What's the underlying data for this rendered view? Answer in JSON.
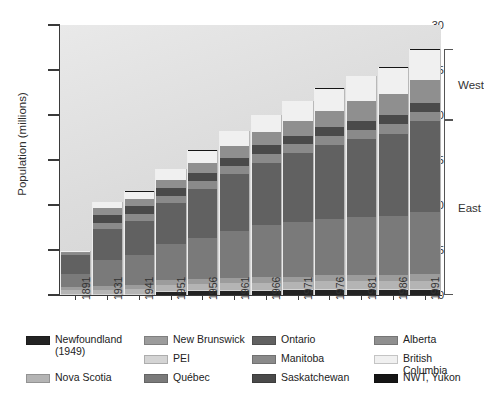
{
  "chart_data": {
    "type": "bar",
    "stacked": true,
    "title": "",
    "xlabel": "",
    "ylabel": "Population (millions)",
    "ylim": [
      0,
      30
    ],
    "yticks": [
      0,
      5,
      10,
      15,
      20,
      25,
      30
    ],
    "ytick_labels": [
      "0",
      "5",
      "10",
      "15",
      "20",
      "25",
      "30"
    ],
    "grid": false,
    "legend_position": "bottom",
    "categories": [
      "1891",
      "1931",
      "1941",
      "1951",
      "1956",
      "1961",
      "1966",
      "1971",
      "1976",
      "1981",
      "1986",
      "1991"
    ],
    "totals": [
      4.8,
      10.4,
      11.5,
      14.0,
      16.0,
      18.2,
      20.0,
      21.6,
      23.0,
      24.3,
      25.3,
      27.3
    ],
    "series": [
      {
        "name": "Newfoundland (1949)",
        "color": "#232323",
        "values": [
          0.0,
          0.0,
          0.0,
          0.36,
          0.42,
          0.46,
          0.49,
          0.52,
          0.56,
          0.57,
          0.57,
          0.57
        ]
      },
      {
        "name": "PEI",
        "color": "#d4d4d4",
        "values": [
          0.11,
          0.09,
          0.09,
          0.1,
          0.1,
          0.11,
          0.11,
          0.11,
          0.12,
          0.12,
          0.13,
          0.13
        ]
      },
      {
        "name": "Nova Scotia",
        "color": "#b4b4b4",
        "values": [
          0.45,
          0.51,
          0.58,
          0.64,
          0.69,
          0.74,
          0.76,
          0.79,
          0.83,
          0.85,
          0.87,
          0.9
        ]
      },
      {
        "name": "New Brunswick",
        "color": "#9c9c9c",
        "values": [
          0.32,
          0.41,
          0.46,
          0.52,
          0.55,
          0.6,
          0.62,
          0.63,
          0.68,
          0.7,
          0.71,
          0.72
        ]
      },
      {
        "name": "Québec",
        "color": "#7a7a7a",
        "values": [
          1.49,
          2.87,
          3.33,
          4.06,
          4.63,
          5.26,
          5.78,
          6.03,
          6.23,
          6.44,
          6.53,
          6.9
        ]
      },
      {
        "name": "Ontario",
        "color": "#616161",
        "values": [
          2.11,
          3.43,
          3.79,
          4.6,
          5.4,
          6.24,
          6.96,
          7.7,
          8.26,
          8.63,
          9.1,
          10.08
        ]
      },
      {
        "name": "Manitoba",
        "color": "#8a8a8a",
        "values": [
          0.15,
          0.7,
          0.73,
          0.78,
          0.85,
          0.92,
          0.96,
          0.99,
          1.02,
          1.03,
          1.07,
          1.09
        ]
      },
      {
        "name": "Saskatchewan",
        "color": "#4a4a4a",
        "values": [
          0.09,
          0.92,
          0.9,
          0.83,
          0.88,
          0.93,
          0.96,
          0.93,
          0.92,
          0.97,
          1.01,
          0.99
        ]
      },
      {
        "name": "Alberta",
        "color": "#8f8f8f",
        "values": [
          0.1,
          0.73,
          0.8,
          0.94,
          1.12,
          1.33,
          1.46,
          1.63,
          1.84,
          2.24,
          2.37,
          2.55
        ]
      },
      {
        "name": "British Columbia",
        "color": "#f0f0f0",
        "values": [
          0.1,
          0.69,
          0.82,
          1.17,
          1.4,
          1.63,
          1.87,
          2.18,
          2.47,
          2.74,
          2.88,
          3.28
        ]
      },
      {
        "name": "NWT, Yukon",
        "color": "#151515",
        "values": [
          0.02,
          0.02,
          0.02,
          0.03,
          0.03,
          0.04,
          0.05,
          0.06,
          0.07,
          0.07,
          0.08,
          0.09
        ]
      }
    ],
    "annotations": [
      {
        "label": "West",
        "position": "right"
      },
      {
        "label": "East",
        "position": "right"
      }
    ]
  },
  "brackets": [
    {
      "label": "West",
      "top_value": 27.3,
      "bottom_value": 19.4
    },
    {
      "label": "East",
      "top_value": 19.4,
      "bottom_value": 0
    }
  ],
  "legend": {
    "items": [
      {
        "label": "Newfoundland (1949)",
        "color": "#232323"
      },
      {
        "label": "New Brunswick",
        "color": "#9c9c9c"
      },
      {
        "label": "Ontario",
        "color": "#616161"
      },
      {
        "label": "Alberta",
        "color": "#8f8f8f"
      },
      {
        "label": "PEI",
        "color": "#d4d4d4"
      },
      {
        "label": "Manitoba",
        "color": "#8a8a8a"
      },
      {
        "label": "British Columbia",
        "color": "#f0f0f0"
      },
      {
        "label": "Nova Scotia",
        "color": "#b4b4b4"
      },
      {
        "label": "Québec",
        "color": "#7a7a7a"
      },
      {
        "label": "Saskatchewan",
        "color": "#4a4a4a"
      },
      {
        "label": "NWT, Yukon",
        "color": "#151515"
      }
    ]
  },
  "colors": {
    "axis": "#3a3a3a",
    "text": "#2f2f2f",
    "plot_bg_top": "#e9e9e9",
    "plot_bg_bottom": "#cfcfcf",
    "page_bg": "#ffffff"
  }
}
